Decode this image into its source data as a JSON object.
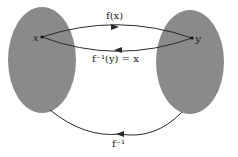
{
  "diagram": {
    "colors": {
      "set_fill": "#8a8a8a",
      "line": "#2a2a2a",
      "background": "#ffffff"
    },
    "domain_set": {
      "point_label": "x"
    },
    "codomain_set": {
      "point_label": "y"
    },
    "arrows": {
      "forward": {
        "label": "f(x)"
      },
      "inverse_point": {
        "label": "f⁻¹(y) = x"
      },
      "inverse_map": {
        "label": "f⁻¹"
      }
    }
  }
}
